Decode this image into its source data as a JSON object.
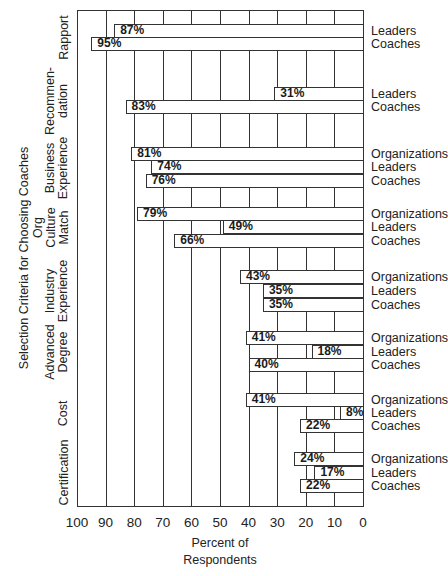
{
  "chart_data": {
    "type": "bar",
    "orientation": "horizontal",
    "title": "",
    "xlabel": "Percent of Respondents",
    "xlabel_lines": [
      "Percent of",
      "Respondents"
    ],
    "ylabel": "Selection Criteria for Choosing Coaches",
    "xlim": [
      100,
      0
    ],
    "x_reversed": true,
    "xticks": [
      100,
      90,
      80,
      70,
      60,
      50,
      40,
      30,
      20,
      10,
      0
    ],
    "grid": true,
    "legend_position": "right (per-bar labels)",
    "groups": [
      {
        "category": "Rapport",
        "category_lines": [
          "Rapport"
        ],
        "bars": [
          {
            "series": "Leaders",
            "value": 87
          },
          {
            "series": "Coaches",
            "value": 95
          }
        ]
      },
      {
        "category": "Recommendation",
        "category_lines": [
          "Recommen-",
          "dation"
        ],
        "bars": [
          {
            "series": "Leaders",
            "value": 31
          },
          {
            "series": "Coaches",
            "value": 83
          }
        ]
      },
      {
        "category": "Business Experience",
        "category_lines": [
          "Business",
          "Experience"
        ],
        "bars": [
          {
            "series": "Organizations",
            "value": 81
          },
          {
            "series": "Leaders",
            "value": 74
          },
          {
            "series": "Coaches",
            "value": 76
          }
        ]
      },
      {
        "category": "Org Culture Match",
        "category_lines": [
          "Org",
          "Culture",
          "Match"
        ],
        "bars": [
          {
            "series": "Organizations",
            "value": 79
          },
          {
            "series": "Leaders",
            "value": 49
          },
          {
            "series": "Coaches",
            "value": 66
          }
        ]
      },
      {
        "category": "Industry Experience",
        "category_lines": [
          "Industry",
          "Experience"
        ],
        "bars": [
          {
            "series": "Organizations",
            "value": 43
          },
          {
            "series": "Leaders",
            "value": 35
          },
          {
            "series": "Coaches",
            "value": 35
          }
        ]
      },
      {
        "category": "Advanced Degree",
        "category_lines": [
          "Advanced",
          "Degree"
        ],
        "bars": [
          {
            "series": "Organizations",
            "value": 41
          },
          {
            "series": "Leaders",
            "value": 18
          },
          {
            "series": "Coaches",
            "value": 40
          }
        ]
      },
      {
        "category": "Cost",
        "category_lines": [
          "Cost"
        ],
        "bars": [
          {
            "series": "Organizations",
            "value": 41
          },
          {
            "series": "Leaders",
            "value": 8
          },
          {
            "series": "Coaches",
            "value": 22
          }
        ]
      },
      {
        "category": "Certification",
        "category_lines": [
          "Certification"
        ],
        "bars": [
          {
            "series": "Organizations",
            "value": 24
          },
          {
            "series": "Leaders",
            "value": 17
          },
          {
            "series": "Coaches",
            "value": 22
          }
        ]
      }
    ],
    "series": [
      {
        "name": "Organizations",
        "values": [
          null,
          null,
          81,
          79,
          43,
          41,
          41,
          24
        ]
      },
      {
        "name": "Leaders",
        "values": [
          87,
          31,
          74,
          49,
          35,
          18,
          8,
          17
        ]
      },
      {
        "name": "Coaches",
        "values": [
          95,
          83,
          76,
          66,
          35,
          40,
          22,
          22
        ]
      }
    ],
    "categories": [
      "Rapport",
      "Recommendation",
      "Business Experience",
      "Org Culture Match",
      "Industry Experience",
      "Advanced Degree",
      "Cost",
      "Certification"
    ]
  },
  "layout": {
    "row_tops": [
      [
        24,
        37
      ],
      [
        87,
        100
      ],
      [
        147,
        160,
        174
      ],
      [
        207,
        220,
        234
      ],
      [
        270,
        284,
        298
      ],
      [
        331,
        345,
        358
      ],
      [
        393,
        406,
        419
      ],
      [
        452,
        466,
        479
      ]
    ]
  },
  "colors": {
    "line": "#333333",
    "bar_fill": "#ffffff",
    "text": "#222222"
  }
}
